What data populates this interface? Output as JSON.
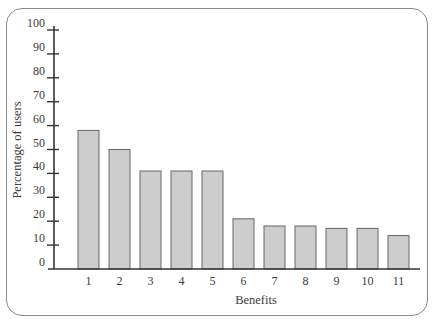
{
  "chart_data": {
    "type": "bar",
    "title": "",
    "xlabel": "Benefits",
    "ylabel": "Percentage of users",
    "categories": [
      "1",
      "2",
      "3",
      "4",
      "5",
      "6",
      "7",
      "8",
      "9",
      "10",
      "11"
    ],
    "values": [
      58,
      50,
      41,
      41,
      41,
      21,
      18,
      18,
      17,
      17,
      14
    ],
    "ylim": [
      0,
      100
    ],
    "yticks": [
      0,
      10,
      20,
      30,
      40,
      50,
      60,
      70,
      80,
      90,
      100
    ],
    "grid": false,
    "legend": null,
    "colors": {
      "bar_fill": "#cdcdcd",
      "bar_stroke": "#666666",
      "axis": "#333333",
      "frame": "#8a8a8a"
    }
  }
}
